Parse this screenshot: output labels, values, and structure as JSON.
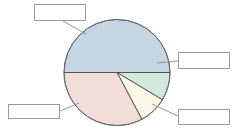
{
  "figure": {
    "background_color": "#ffffff",
    "width": 246,
    "height": 135
  },
  "chart_data": {
    "type": "pie",
    "title": "",
    "subtitle": "",
    "xlabel": "",
    "ylabel": "",
    "legend_position": "callout-labels",
    "grid": false,
    "center": {
      "x": 117,
      "y": 72.5
    },
    "radius": 53,
    "start_angle_deg": 180,
    "direction": "clockwise",
    "categories": [
      "",
      "",
      "",
      ""
    ],
    "values": [
      50,
      12,
      10,
      28
    ],
    "labels": [
      "",
      "",
      "",
      ""
    ],
    "colors": [
      "#c6d5e2",
      "#d2e7dd",
      "#f9f8e6",
      "#f2ddd9"
    ],
    "slice_edge_color": "#4a4a4a",
    "slices": [
      {
        "name": "slice-top-blue",
        "value": 50,
        "percent": "50%",
        "color": "#c6d5e2",
        "start_angle_deg": 180,
        "end_angle_deg": 360,
        "label": ""
      },
      {
        "name": "slice-right-green",
        "value": 12,
        "percent": "12%",
        "color": "#d2e7dd",
        "start_angle_deg": 0,
        "end_angle_deg": 31,
        "label": ""
      },
      {
        "name": "slice-right-cream",
        "value": 10,
        "percent": "10%",
        "color": "#f9f8e6",
        "start_angle_deg": 31,
        "end_angle_deg": 62,
        "label": ""
      },
      {
        "name": "slice-bottom-pink",
        "value": 28,
        "percent": "28%",
        "color": "#f2ddd9",
        "start_angle_deg": 62,
        "end_angle_deg": 180,
        "label": ""
      }
    ]
  },
  "callouts": [
    {
      "id": "callout-top-left",
      "text": "",
      "border_color": "#9a9a9a",
      "fill_color": "#ffffff",
      "leader_from": {
        "x": 63,
        "y": 21
      },
      "leader_to": {
        "x": 86,
        "y": 34
      }
    },
    {
      "id": "callout-right-upper",
      "text": "",
      "border_color": "#9a9a9a",
      "fill_color": "#ffffff",
      "leader_from": {
        "x": 178,
        "y": 61
      },
      "leader_to": {
        "x": 157,
        "y": 63
      }
    },
    {
      "id": "callout-bottom-left",
      "text": "",
      "border_color": "#9a9a9a",
      "fill_color": "#ffffff",
      "leader_from": {
        "x": 60,
        "y": 111
      },
      "leader_to": {
        "x": 79,
        "y": 103
      }
    },
    {
      "id": "callout-bottom-right",
      "text": "",
      "border_color": "#9a9a9a",
      "fill_color": "#ffffff",
      "leader_from": {
        "x": 178,
        "y": 116
      },
      "leader_to": {
        "x": 152,
        "y": 104
      }
    }
  ],
  "leader_line_color": "#8a8a8a"
}
